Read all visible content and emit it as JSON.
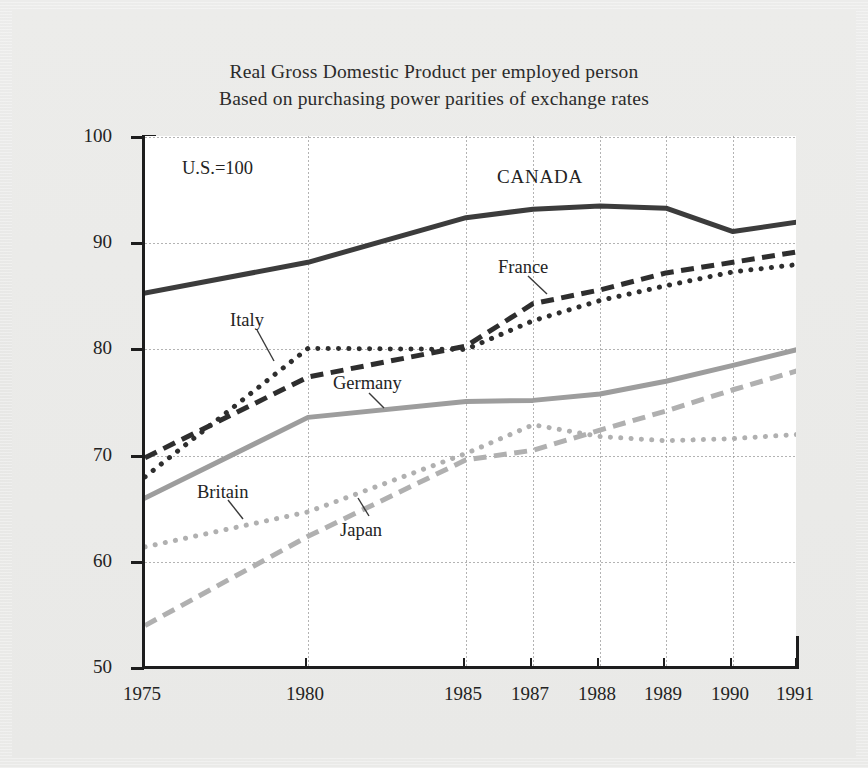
{
  "figure": {
    "title_line1": "Real Gross Domestic Product per employed person",
    "title_line2": "Based on purchasing power parities of exchange rates",
    "note": "U.S.=100"
  },
  "annotations": [
    {
      "name": "canada",
      "label": "CANADA"
    },
    {
      "name": "france",
      "label": "France"
    },
    {
      "name": "italy",
      "label": "Italy"
    },
    {
      "name": "germany",
      "label": "Germany"
    },
    {
      "name": "britain",
      "label": "Britain"
    },
    {
      "name": "japan",
      "label": "Japan"
    }
  ],
  "axes": {
    "y_ticks": [
      "100",
      "90",
      "80",
      "70",
      "60",
      "50"
    ],
    "x_ticks": [
      "1975",
      "1980",
      "1985",
      "1987",
      "1988",
      "1989",
      "1990",
      "1991"
    ]
  },
  "chart_data": {
    "type": "line",
    "title": "Real Gross Domestic Product per employed person",
    "subtitle": "Based on purchasing power parities of exchange rates",
    "xlabel": "",
    "ylabel": "",
    "note": "U.S.=100",
    "grid": true,
    "legend": "inline-annotations",
    "ylim": [
      50,
      100
    ],
    "x": [
      "1975",
      "1980",
      "1985",
      "1987",
      "1988",
      "1989",
      "1990",
      "1991"
    ],
    "x_positions_nonuniform": true,
    "series": [
      {
        "name": "CANADA",
        "style": "solid",
        "color": "#3c3c3c",
        "width": 5,
        "values": [
          85.3,
          88.2,
          92.4,
          93.2,
          93.5,
          93.3,
          91.1,
          92.0
        ]
      },
      {
        "name": "France",
        "style": "dashed",
        "color": "#2e2e2e",
        "width": 5,
        "values": [
          69.8,
          77.4,
          80.3,
          84.3,
          85.6,
          87.2,
          88.2,
          89.2
        ]
      },
      {
        "name": "Italy",
        "style": "dotted",
        "color": "#2e2e2e",
        "width": 5,
        "values": [
          68.0,
          80.1,
          80.0,
          82.7,
          84.6,
          86.0,
          87.3,
          88.0
        ]
      },
      {
        "name": "Germany",
        "style": "solid",
        "color": "#9d9d9d",
        "width": 5,
        "values": [
          66.0,
          73.6,
          75.1,
          75.2,
          75.8,
          77.0,
          78.5,
          80.0
        ]
      },
      {
        "name": "Britain",
        "style": "dotted",
        "color": "#b0b0b0",
        "width": 5,
        "values": [
          61.4,
          64.7,
          70.2,
          72.9,
          71.8,
          71.4,
          71.6,
          72.0
        ]
      },
      {
        "name": "Japan",
        "style": "dashed",
        "color": "#b0b0b0",
        "width": 5,
        "values": [
          54.0,
          62.4,
          69.6,
          70.5,
          72.4,
          74.2,
          76.2,
          78.0
        ]
      }
    ]
  }
}
